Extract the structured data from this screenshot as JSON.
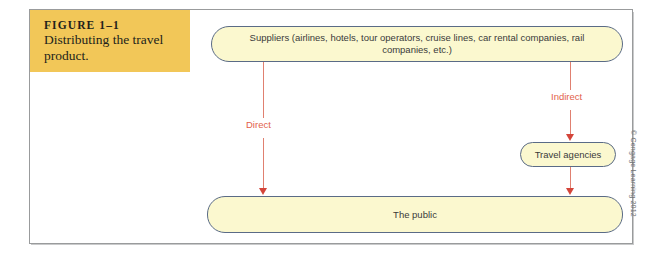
{
  "figure": {
    "label": "FIGURE 1–1",
    "title": "Distributing the travel product.",
    "credit": "© Cengage Learning 2012"
  },
  "diagram": {
    "nodes": [
      {
        "id": "suppliers",
        "label": "Suppliers (airlines, hotels, tour operators, cruise lines, car rental companies, rail companies, etc.)"
      },
      {
        "id": "travel-agencies",
        "label": "Travel agencies"
      },
      {
        "id": "public",
        "label": "The public"
      }
    ],
    "edges": [
      {
        "id": "direct",
        "from": "suppliers",
        "to": "public",
        "label": "Direct"
      },
      {
        "id": "indirect",
        "from": "suppliers",
        "to": "travel-agencies",
        "label": "Indirect"
      },
      {
        "id": "agencies-to-public",
        "from": "travel-agencies",
        "to": "public",
        "label": ""
      }
    ]
  },
  "colors": {
    "caption_background": "#f2c758",
    "box_fill": "#fbf8cf",
    "box_border": "#5a6b86",
    "arrow": "#e08070",
    "arrow_head": "#d4453a",
    "arrow_label": "#e2614a",
    "frame_border": "#999b9c"
  }
}
